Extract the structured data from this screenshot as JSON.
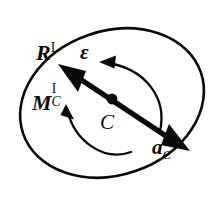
{
  "figure": {
    "background_color": "#ffffff",
    "stroke_color": "#0a0a0a",
    "width": 224,
    "height": 209
  },
  "body_outline": {
    "shape": "ellipse",
    "name": "rigid-body-outline",
    "center": [
      112,
      103
    ],
    "radius_x": 94,
    "radius_y": 72,
    "rotation_deg": -19,
    "stroke_width": 2.6,
    "fill": "none"
  },
  "center_point": {
    "name": "center-of-mass-point",
    "x": 112,
    "y": 99,
    "radius": 5.2,
    "fill": "#0a0a0a"
  },
  "double_arrow": {
    "name": "acceleration-force-axis",
    "description": "double-headed straight vector through point C",
    "tail": [
      185,
      148
    ],
    "head": [
      60,
      66
    ],
    "angle_deg": -33,
    "shaft_width": 5,
    "arrowhead_length": 22,
    "arrowhead_width": 17
  },
  "arcs": [
    {
      "name": "angular-acceleration-arc",
      "label_ref": "epsilon",
      "direction": "counterclockwise-pointing-left",
      "start": [
        158,
        128
      ],
      "end": [
        99,
        62
      ],
      "stroke_width": 2.2
    },
    {
      "name": "moment-arc",
      "label_ref": "moment",
      "direction": "counterclockwise-pointing-upleft",
      "start": [
        130,
        152
      ],
      "end": [
        68,
        104
      ],
      "stroke_width": 2.2
    }
  ],
  "labels": {
    "resultant_force": {
      "name": "label-resultant-force",
      "base": "R",
      "superscript": "I",
      "subscript": "",
      "style": "bold-italic-vector",
      "meaning": "resultant force vector, frame I"
    },
    "epsilon": {
      "name": "label-angular-acceleration",
      "base": "ε",
      "superscript": "",
      "subscript": "",
      "style": "bold-italic-vector",
      "meaning": "angular acceleration"
    },
    "moment": {
      "name": "label-moment-about-c",
      "base": "M",
      "superscript": "I",
      "subscript": "C",
      "style": "bold-italic-vector-stacked",
      "meaning": "resultant moment about C, frame I"
    },
    "center": {
      "name": "label-center-point",
      "base": "C",
      "superscript": "",
      "subscript": "",
      "style": "plain-italic",
      "meaning": "center of mass"
    },
    "acceleration": {
      "name": "label-acceleration-of-c",
      "base": "a",
      "superscript": "",
      "subscript": "C",
      "style": "bold-italic-vector",
      "meaning": "acceleration of point C"
    }
  }
}
